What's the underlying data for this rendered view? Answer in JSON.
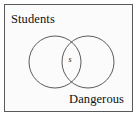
{
  "figure": {
    "type": "venn-diagram",
    "frame": {
      "border_color": "#5a5a5a",
      "background_color": "#fbfbfb"
    },
    "sets": [
      {
        "id": "students",
        "label": "Students",
        "position": "top-left",
        "circle": {
          "cx": 51,
          "cy": 58,
          "r": 26
        }
      },
      {
        "id": "dangerous",
        "label": "Dangerous",
        "position": "bottom-right",
        "circle": {
          "cx": 84,
          "cy": 58,
          "r": 26
        }
      }
    ],
    "regions": [
      {
        "id": "intersection",
        "label": "s",
        "description": "overlap of Students and Dangerous"
      }
    ],
    "stroke_color": "#4a4a4a",
    "text_color": "#111111"
  }
}
